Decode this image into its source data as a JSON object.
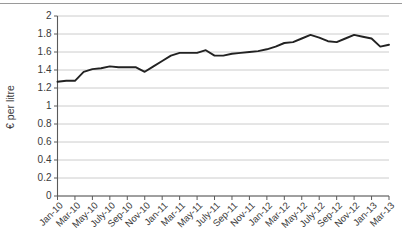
{
  "chart_data": {
    "type": "line",
    "title": "",
    "xlabel": "",
    "ylabel": "€ per litre",
    "ylim": [
      0,
      2
    ],
    "ytick_step": 0.2,
    "grid": true,
    "legend": false,
    "yticks": [
      "0",
      "0.2",
      "0.4",
      "0.6",
      "0.8",
      "1",
      "1.2",
      "1.4",
      "1.6",
      "1.8",
      "2"
    ],
    "xtick_labels": [
      "Jan-10",
      "Mar-10",
      "May-10",
      "July-10",
      "Sep-10",
      "Nov-10",
      "Jan-11",
      "Mar-11",
      "May-11",
      "July-11",
      "Sep-11",
      "Nov-11",
      "Jan-12",
      "Mar-12",
      "May-12",
      "July-12",
      "Sep-12",
      "Nov-12",
      "Jan-13",
      "Mar-13"
    ],
    "x": [
      "Jan-10",
      "Feb-10",
      "Mar-10",
      "Apr-10",
      "May-10",
      "June-10",
      "July-10",
      "Aug-10",
      "Sep-10",
      "Oct-10",
      "Nov-10",
      "Dec-10",
      "Jan-11",
      "Feb-11",
      "Mar-11",
      "Apr-11",
      "May-11",
      "June-11",
      "July-11",
      "Aug-11",
      "Sep-11",
      "Oct-11",
      "Nov-11",
      "Dec-11",
      "Jan-12",
      "Feb-12",
      "Mar-12",
      "Apr-12",
      "May-12",
      "June-12",
      "July-12",
      "Aug-12",
      "Sep-12",
      "Oct-12",
      "Nov-12",
      "Dec-12",
      "Jan-13",
      "Feb-13",
      "Mar-13"
    ],
    "series": [
      {
        "name": "€ per litre",
        "color": "#222222",
        "values": [
          1.27,
          1.28,
          1.28,
          1.38,
          1.41,
          1.42,
          1.44,
          1.43,
          1.43,
          1.43,
          1.38,
          1.44,
          1.5,
          1.56,
          1.59,
          1.59,
          1.59,
          1.62,
          1.56,
          1.56,
          1.58,
          1.59,
          1.6,
          1.61,
          1.63,
          1.66,
          1.7,
          1.71,
          1.75,
          1.79,
          1.76,
          1.72,
          1.71,
          1.75,
          1.79,
          1.77,
          1.75,
          1.66,
          1.68
        ]
      }
    ]
  }
}
